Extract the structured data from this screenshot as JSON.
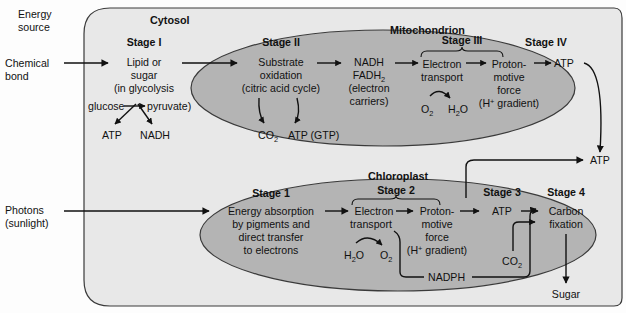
{
  "figure": {
    "type": "biological-pathway-diagram"
  },
  "colors": {
    "cell_fill": "#e8e8e8",
    "organelle_fill": "#b4b4b4",
    "outline": "#3a3a3a",
    "text": "#111111",
    "page_background": "#fdfdfd",
    "bleed_text": "#e2e2e2"
  },
  "bleed_through": {
    "line1": "ULAR",
    "line2": "ETICS"
  },
  "left_labels": {
    "energy_source": {
      "line1": "Energy",
      "line2": "source"
    },
    "chemical_bond": {
      "line1": "Chemical",
      "line2": "bond"
    },
    "photons": {
      "line1": "Photons",
      "line2": "(sunlight)"
    }
  },
  "compartments": {
    "cytosol": "Cytosol",
    "mitochondrion": "Mitochondrion",
    "chloroplast": "Chloroplast"
  },
  "catabolism": {
    "stage1": {
      "heading": "Stage I",
      "line1": "Lipid or",
      "line2": "sugar",
      "line3": "(in glycolysis",
      "glucose": "glucose",
      "pyruvate": "pyruvate)",
      "product1": "ATP",
      "product2": "NADH"
    },
    "stage2": {
      "heading": "Stage II",
      "line1": "Substrate",
      "line2": "oxidation",
      "line3": "(citric acid cycle)",
      "out1": "CO",
      "out1_sub": "2",
      "out2": "ATP (GTP)"
    },
    "carriers": {
      "line1": "NADH",
      "line2": "FADH",
      "line2_sub": "2",
      "line3": "(electron",
      "line4": "carriers)"
    },
    "stage3": {
      "heading": "Stage III",
      "transport_line1": "Electron",
      "transport_line2": "transport",
      "reactant": "O",
      "reactant_sub": "2",
      "product": "H",
      "product_sub": "2",
      "product_tail": "O",
      "pmf_line1": "Proton-",
      "pmf_line2": "motive",
      "pmf_line3": "force",
      "pmf_line4_pre": "(H",
      "pmf_line4_sup": "+",
      "pmf_line4_post": " gradient)"
    },
    "stage4": {
      "heading": "Stage IV",
      "product": "ATP"
    }
  },
  "photosynthesis": {
    "stage1": {
      "heading": "Stage 1",
      "line1": "Energy absorption",
      "line2": "by pigments and",
      "line3": "direct transfer",
      "line4": "to electrons"
    },
    "stage2": {
      "heading": "Stage 2",
      "transport_line1": "Electron",
      "transport_line2": "transport",
      "reactant": "H",
      "reactant_sub": "2",
      "reactant_tail": "O",
      "product": "O",
      "product_sub": "2",
      "pmf_line1": "Proton-",
      "pmf_line2": "motive",
      "pmf_line3": "force",
      "pmf_line4_pre": "(H",
      "pmf_line4_sup": "+",
      "pmf_line4_post": " gradient)",
      "nadph": "NADPH"
    },
    "stage3": {
      "heading": "Stage 3",
      "product": "ATP"
    },
    "stage4": {
      "heading": "Stage 4",
      "line1": "Carbon",
      "line2": "fixation",
      "input": "CO",
      "input_sub": "2",
      "output": "Sugar"
    }
  },
  "cytosol_output": {
    "atp": "ATP"
  }
}
